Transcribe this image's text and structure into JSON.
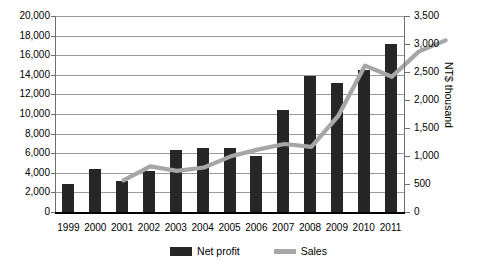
{
  "chart_data": {
    "type": "bar",
    "title": "",
    "xlabel": "",
    "ylabel": "",
    "grid": true,
    "legend_position": "bottom",
    "categories": [
      "1999",
      "2000",
      "2001",
      "2002",
      "2003",
      "2004",
      "2005",
      "2006",
      "2007",
      "2008",
      "2009",
      "2010",
      "2011"
    ],
    "series": [
      {
        "name": "Net profit",
        "type": "bar",
        "axis": "left",
        "color": "#262626",
        "values": [
          2900,
          4400,
          3200,
          4200,
          6300,
          6500,
          6500,
          5700,
          10400,
          13900,
          13200,
          14500,
          17100
        ]
      },
      {
        "name": "Sales",
        "type": "line",
        "axis": "right",
        "color": "#a6a6a6",
        "values": [
          850,
          1100,
          1020,
          1080,
          1280,
          1400,
          1500,
          1450,
          2000,
          2900,
          2700,
          3150,
          3350
        ]
      }
    ],
    "left_axis": {
      "label": "",
      "min": 0,
      "max": 20000,
      "step": 2000,
      "ticks": [
        "0",
        "2,000",
        "4,000",
        "6,000",
        "8,000",
        "10,000",
        "12,000",
        "14,000",
        "16,000",
        "18,000",
        "20,000"
      ]
    },
    "right_axis": {
      "label": "NT$ thousand",
      "min": 0,
      "max": 3500,
      "step": 500,
      "ticks": [
        "0",
        "500",
        "1,000",
        "1,500",
        "2,000",
        "2,500",
        "3,000",
        "3,500"
      ]
    },
    "legend": [
      {
        "label": "Net profit",
        "color": "#262626",
        "marker": "bar"
      },
      {
        "label": "Sales",
        "color": "#a6a6a6",
        "marker": "line"
      }
    ]
  }
}
